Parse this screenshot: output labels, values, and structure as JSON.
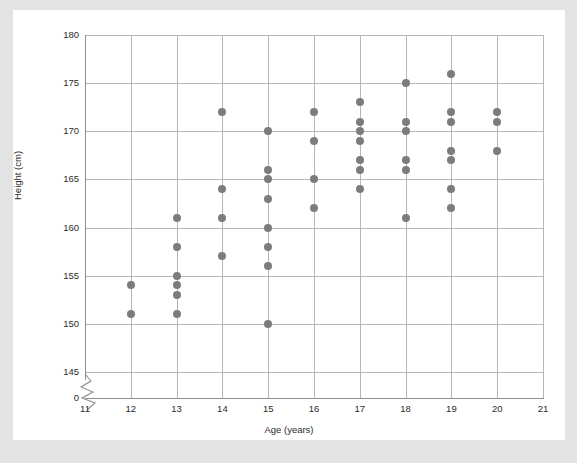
{
  "chart_data": {
    "type": "scatter",
    "title": "",
    "xlabel": "Age (years)",
    "ylabel": "Height (cm)",
    "xlim": [
      11,
      21
    ],
    "ylim": [
      145,
      180
    ],
    "y_axis_break": true,
    "y_break_label": "0",
    "grid": true,
    "legend": null,
    "xticks": [
      11,
      12,
      13,
      14,
      15,
      16,
      17,
      18,
      19,
      20,
      21
    ],
    "xtick_labels": [
      "11",
      "12",
      "13",
      "14",
      "15",
      "16",
      "17",
      "18",
      "19",
      "20",
      "21"
    ],
    "yticks": [
      145,
      150,
      155,
      160,
      165,
      170,
      175,
      180
    ],
    "ytick_labels": [
      "145",
      "150",
      "155",
      "160",
      "165",
      "170",
      "175",
      "180"
    ],
    "marker_color": "#7c7c7c",
    "grid_color": "#b6b6b6",
    "axis_color": "#8d8d8d",
    "background_color": "#ffffff",
    "page_background_color": "#e3e3e3",
    "points": [
      {
        "x": 12,
        "y": 154
      },
      {
        "x": 12,
        "y": 151
      },
      {
        "x": 13,
        "y": 161
      },
      {
        "x": 13,
        "y": 158
      },
      {
        "x": 13,
        "y": 155
      },
      {
        "x": 13,
        "y": 154
      },
      {
        "x": 13,
        "y": 153
      },
      {
        "x": 13,
        "y": 151
      },
      {
        "x": 14,
        "y": 172
      },
      {
        "x": 14,
        "y": 164
      },
      {
        "x": 14,
        "y": 161
      },
      {
        "x": 14,
        "y": 157
      },
      {
        "x": 15,
        "y": 170
      },
      {
        "x": 15,
        "y": 166
      },
      {
        "x": 15,
        "y": 165
      },
      {
        "x": 15,
        "y": 163
      },
      {
        "x": 15,
        "y": 160
      },
      {
        "x": 15,
        "y": 158
      },
      {
        "x": 15,
        "y": 156
      },
      {
        "x": 15,
        "y": 150
      },
      {
        "x": 16,
        "y": 172
      },
      {
        "x": 16,
        "y": 169
      },
      {
        "x": 16,
        "y": 165
      },
      {
        "x": 16,
        "y": 162
      },
      {
        "x": 17,
        "y": 173
      },
      {
        "x": 17,
        "y": 171
      },
      {
        "x": 17,
        "y": 170
      },
      {
        "x": 17,
        "y": 169
      },
      {
        "x": 17,
        "y": 167
      },
      {
        "x": 17,
        "y": 166
      },
      {
        "x": 17,
        "y": 164
      },
      {
        "x": 18,
        "y": 175
      },
      {
        "x": 18,
        "y": 171
      },
      {
        "x": 18,
        "y": 170
      },
      {
        "x": 18,
        "y": 167
      },
      {
        "x": 18,
        "y": 166
      },
      {
        "x": 18,
        "y": 161
      },
      {
        "x": 19,
        "y": 176
      },
      {
        "x": 19,
        "y": 172
      },
      {
        "x": 19,
        "y": 171
      },
      {
        "x": 19,
        "y": 168
      },
      {
        "x": 19,
        "y": 167
      },
      {
        "x": 19,
        "y": 164
      },
      {
        "x": 19,
        "y": 162
      },
      {
        "x": 20,
        "y": 172
      },
      {
        "x": 20,
        "y": 171
      },
      {
        "x": 20,
        "y": 168
      }
    ]
  }
}
